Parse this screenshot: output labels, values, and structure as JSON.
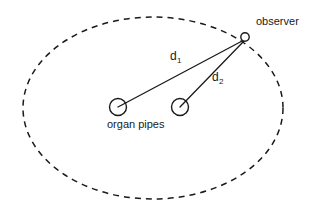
{
  "figure": {
    "type": "schematic-diagram",
    "background_color": "#ffffff",
    "stroke_color": "#1a1a1a",
    "width": 324,
    "height": 216
  },
  "labels": {
    "observer": "observer",
    "organ_pipes": "organ pipes",
    "d1_base": "d",
    "d1_sub": "1",
    "d2_base": "d",
    "d2_sub": "2"
  },
  "geometry": {
    "boundary_ellipse": {
      "cx": 153,
      "cy": 108,
      "rx": 130,
      "ry": 91,
      "style": "dashed",
      "dash_pattern": "6 5"
    },
    "observer_point": {
      "cx": 245,
      "cy": 37,
      "r": 4.2
    },
    "source_left": {
      "cx": 118,
      "cy": 107,
      "r": 8.5
    },
    "source_right": {
      "cx": 180,
      "cy": 107,
      "r": 8.5
    },
    "ray_d1": {
      "x1": 118,
      "y1": 107,
      "x2": 244,
      "y2": 40
    },
    "ray_d2": {
      "x1": 180,
      "y1": 107,
      "x2": 244,
      "y2": 41
    }
  }
}
